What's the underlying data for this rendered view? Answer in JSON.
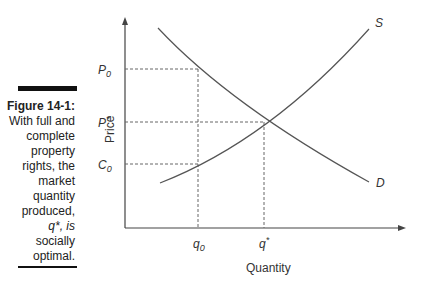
{
  "figure": {
    "number_label": "Figure 14-1:",
    "caption_lines": [
      "With full and",
      "complete",
      "property",
      "rights, the",
      "market",
      "quantity",
      "produced,",
      "q*, is",
      "socially",
      "optimal."
    ]
  },
  "diagram": {
    "y_axis_label": "Price",
    "x_axis_label": "Quantity",
    "price_labels": {
      "p0": "P",
      "p0_sub": "0",
      "pstar": "P",
      "pstar_sup": "*",
      "c0": "C",
      "c0_sub": "0"
    },
    "quantity_labels": {
      "q0": "q",
      "q0_sub": "0",
      "qstar": "q",
      "qstar_sup": "*"
    },
    "curves": {
      "supply": "S",
      "demand": "D"
    },
    "line_color": "#555555"
  }
}
